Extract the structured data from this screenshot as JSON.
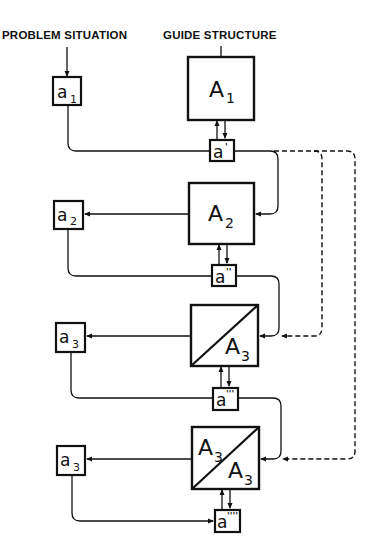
{
  "headers": {
    "left": "PROBLEM SITUATION",
    "right": "GUIDE STRUCTURE"
  },
  "guide_boxes": [
    {
      "letter": "A",
      "sub": "1"
    },
    {
      "letter": "A",
      "sub": "2"
    },
    {
      "letter": "A",
      "sub": "3"
    },
    {
      "top_letter": "A",
      "top_sub": "3",
      "bottom_letter": "A",
      "bottom_sub": "3"
    }
  ],
  "problem_boxes": [
    {
      "letter": "a",
      "sub": "1"
    },
    {
      "letter": "a",
      "sub": "2"
    },
    {
      "letter": "a",
      "sub": "3"
    },
    {
      "letter": "a",
      "sub": "3"
    }
  ],
  "intermediate_boxes": [
    {
      "letter": "a",
      "prime": "'"
    },
    {
      "letter": "a",
      "prime": "''"
    },
    {
      "letter": "a",
      "prime": "'''"
    },
    {
      "letter": "a",
      "prime": "''''"
    }
  ],
  "colors": {
    "ink": "#111111",
    "paper": "#ffffff"
  }
}
